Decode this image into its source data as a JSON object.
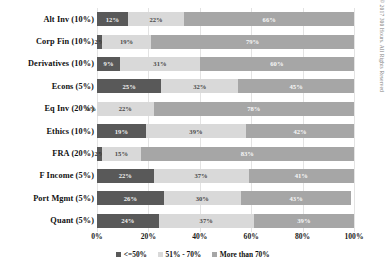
{
  "chart_data": {
    "type": "bar",
    "subtype": "stacked-horizontal-100",
    "title": "",
    "xlabel": "",
    "ylabel": "",
    "xlim": [
      0,
      100
    ],
    "grid": true,
    "legend_position": "bottom",
    "categories": [
      "Alt Inv (10%)",
      "Corp Fin (10%)",
      "Derivatives (10%)",
      "Econs (5%)",
      "Eq Inv (20%)",
      "Ethics (10%)",
      "FRA (20%)",
      "F Income (5%)",
      "Port Mgmt (5%)",
      "Quant (5%)"
    ],
    "series": [
      {
        "name": "<=50%",
        "color": "#595959",
        "values": [
          12,
          2,
          9,
          25,
          0,
          19,
          2,
          22,
          26,
          24
        ],
        "labels": [
          "12%",
          "2%",
          "9%",
          "25%",
          "0%",
          "19%",
          "2%",
          "22%",
          "26%",
          "24%"
        ]
      },
      {
        "name": "51% - 70%",
        "color": "#d9d9d9",
        "values": [
          22,
          19,
          31,
          30,
          22,
          39,
          15,
          37,
          30,
          37
        ],
        "labels": [
          "22%",
          "19%",
          "31%",
          "32%",
          "22%",
          "39%",
          "15%",
          "37%",
          "30%",
          "37%"
        ]
      },
      {
        "name": "More than 70%",
        "color": "#a6a6a6",
        "values": [
          66,
          79,
          60,
          45,
          78,
          42,
          83,
          41,
          43,
          39
        ],
        "labels": [
          "66%",
          "79%",
          "60%",
          "45%",
          "78%",
          "42%",
          "83%",
          "41%",
          "43%",
          "39%"
        ]
      }
    ],
    "xticks": [
      0,
      20,
      40,
      60,
      80,
      100
    ],
    "xtick_labels": [
      "0%",
      "20%",
      "40%",
      "60%",
      "80%",
      "100%"
    ]
  },
  "legend": {
    "items": [
      {
        "label": "<=50%",
        "color": "#595959"
      },
      {
        "label": "51% - 70%",
        "color": "#d9d9d9"
      },
      {
        "label": "More than 70%",
        "color": "#a6a6a6"
      }
    ]
  },
  "footer": {
    "copyright": "Copyright © 2017 300 Hours. All Rights Reserved"
  }
}
